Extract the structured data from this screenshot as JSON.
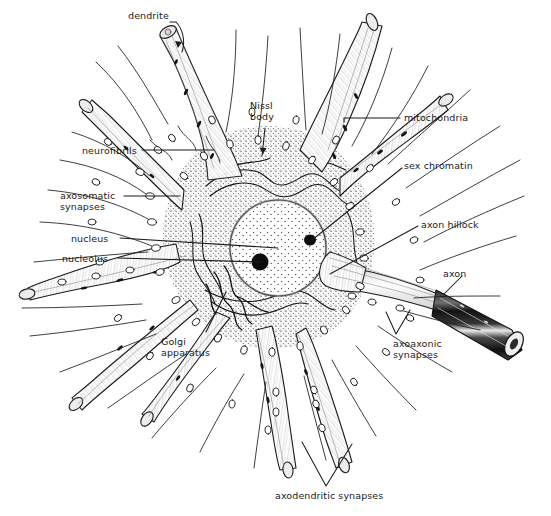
{
  "figure": {
    "kind": "anatomical-line-drawing",
    "background_color": "#ffffff",
    "ink_color": "#1b1b1b",
    "label_color": "#1b1b1b"
  },
  "labels": [
    {
      "id": "dendrite",
      "text": "dendrite",
      "x": 128,
      "y": 10,
      "align": "left"
    },
    {
      "id": "nissl-body",
      "text": "Nissl\nbody",
      "x": 250,
      "y": 100,
      "align": "left"
    },
    {
      "id": "mitochondria",
      "text": "mitochondria",
      "x": 404,
      "y": 112,
      "align": "left"
    },
    {
      "id": "neurofibrils",
      "text": "neurofibrils",
      "x": 82,
      "y": 145,
      "align": "left"
    },
    {
      "id": "sex-chromatin",
      "text": "sex chromatin",
      "x": 404,
      "y": 160,
      "align": "left"
    },
    {
      "id": "axosomatic-synapses",
      "text": "axosomatic\nsynapses",
      "x": 60,
      "y": 190,
      "align": "left"
    },
    {
      "id": "axon-hillock",
      "text": "axon hillock",
      "x": 421,
      "y": 219,
      "align": "left"
    },
    {
      "id": "nucleus",
      "text": "nucleus",
      "x": 71,
      "y": 233,
      "align": "left"
    },
    {
      "id": "nucleolus",
      "text": "nucleolus",
      "x": 62,
      "y": 253,
      "align": "left"
    },
    {
      "id": "axon",
      "text": "axon",
      "x": 443,
      "y": 268,
      "align": "left"
    },
    {
      "id": "golgi-apparatus",
      "text": "Golgi\napparatus",
      "x": 161,
      "y": 336,
      "align": "left"
    },
    {
      "id": "axoaxonic-synapses",
      "text": "axoaxonic\nsynapses",
      "x": 393,
      "y": 338,
      "align": "left"
    },
    {
      "id": "axodendritic-synapses",
      "text": "axodendritic synapses",
      "x": 275,
      "y": 490,
      "align": "left"
    }
  ],
  "structures": [
    {
      "id": "soma",
      "name": "cell body (soma)"
    },
    {
      "id": "nucleus",
      "name": "nucleus"
    },
    {
      "id": "nucleolus",
      "name": "nucleolus"
    },
    {
      "id": "sex-chromatin",
      "name": "sex chromatin body"
    },
    {
      "id": "axon",
      "name": "myelinated axon"
    },
    {
      "id": "dendrites",
      "name": "dendrites"
    },
    {
      "id": "boutons",
      "name": "synaptic boutons"
    }
  ]
}
